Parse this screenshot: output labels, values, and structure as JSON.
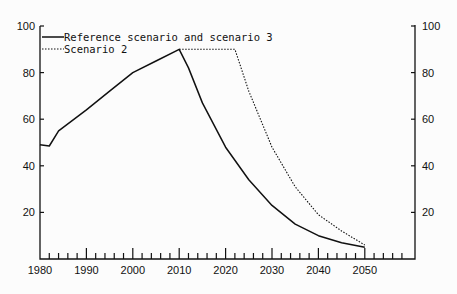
{
  "chart_data": {
    "type": "line",
    "title": "",
    "xlabel": "",
    "ylabel": "",
    "xlim": [
      1980,
      2060
    ],
    "ylim": [
      0,
      100
    ],
    "x_ticks": [
      "1980",
      "1990",
      "2000",
      "2010",
      "2020",
      "2030",
      "2040",
      "2050"
    ],
    "y_ticks": [
      "20",
      "40",
      "60",
      "80",
      "100"
    ],
    "right_y_ticks": [
      "20",
      "40",
      "60",
      "80",
      "100"
    ],
    "legend_position": "top-left",
    "grid": false,
    "series": [
      {
        "name": "Reference scenario and scenario 3",
        "style": "solid",
        "x": [
          1980,
          1982,
          1984,
          1990,
          1995,
          2000,
          2005,
          2010,
          2012,
          2015,
          2020,
          2025,
          2030,
          2035,
          2040,
          2045,
          2050
        ],
        "values": [
          49,
          48.5,
          55,
          64,
          72,
          80,
          85,
          90,
          82,
          67,
          48,
          34,
          23,
          15,
          10,
          7,
          5
        ]
      },
      {
        "name": "Scenario 2",
        "style": "dotted",
        "x": [
          2010,
          2015,
          2022,
          2025,
          2030,
          2035,
          2040,
          2045,
          2050
        ],
        "values": [
          90,
          90,
          90,
          72,
          48,
          31,
          19,
          12,
          6
        ]
      }
    ]
  }
}
